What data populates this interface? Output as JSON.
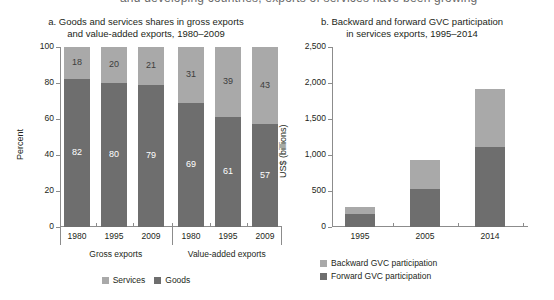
{
  "page": {
    "cutoff_header": "and developing countries, exports of services have been growing"
  },
  "colors": {
    "light": "#a9a9a9",
    "dark": "#6e6e6e",
    "axis": "#8c8c8c",
    "text": "#231f20"
  },
  "chart_data": [
    {
      "type": "bar",
      "id": "panel-a",
      "title": "a. Goods and services shares in gross exports\nand value-added exports, 1980–2009",
      "title_line1": "a. Goods and services shares in gross exports",
      "title_line2": "and value-added exports, 1980–2009",
      "stacked": true,
      "xlabel": "",
      "ylabel": "Percent",
      "ylim": [
        0,
        100
      ],
      "yticks": [
        0,
        20,
        40,
        60,
        80,
        100
      ],
      "ytick_labels": [
        "0",
        "20",
        "40",
        "60",
        "80",
        "100"
      ],
      "grid": false,
      "legend_position": "bottom-center",
      "categories": [
        "1980",
        "1995",
        "2009",
        "1980",
        "1995",
        "2009"
      ],
      "groups": [
        {
          "label": "Gross exports",
          "categories": [
            "1980",
            "1995",
            "2009"
          ]
        },
        {
          "label": "Value-added exports",
          "categories": [
            "1980",
            "1995",
            "2009"
          ]
        }
      ],
      "series": [
        {
          "name": "Services",
          "color": "#a9a9a9",
          "values": [
            18,
            20,
            21,
            31,
            39,
            43
          ]
        },
        {
          "name": "Goods",
          "color": "#6e6e6e",
          "values": [
            82,
            80,
            79,
            69,
            61,
            57
          ]
        }
      ],
      "legend": [
        {
          "label": "Services",
          "color": "#a9a9a9"
        },
        {
          "label": "Goods",
          "color": "#6e6e6e"
        }
      ]
    },
    {
      "type": "bar",
      "id": "panel-b",
      "title": "b. Backward and forward GVC participation\nin services exports, 1995–2014",
      "title_line1": "b. Backward and forward GVC participation",
      "title_line2": "in services exports, 1995–2014",
      "stacked": true,
      "xlabel": "",
      "ylabel": "US$ (billions)",
      "ylim": [
        0,
        2500
      ],
      "yticks": [
        0,
        500,
        1000,
        1500,
        2000,
        2500
      ],
      "ytick_labels": [
        "0",
        "500",
        "1,000",
        "1,500",
        "2,000",
        "2,500"
      ],
      "grid": false,
      "legend_position": "bottom-left",
      "categories": [
        "1995",
        "2005",
        "2014"
      ],
      "series": [
        {
          "name": "Backward GVC participation",
          "color": "#a9a9a9",
          "values": [
            95,
            400,
            810
          ]
        },
        {
          "name": "Forward GVC participation",
          "color": "#6e6e6e",
          "values": [
            185,
            530,
            1110
          ]
        }
      ],
      "totals": [
        280,
        930,
        1920
      ],
      "legend": [
        {
          "label": "Backward GVC participation",
          "color": "#a9a9a9"
        },
        {
          "label": "Forward GVC participation",
          "color": "#6e6e6e"
        }
      ]
    }
  ]
}
